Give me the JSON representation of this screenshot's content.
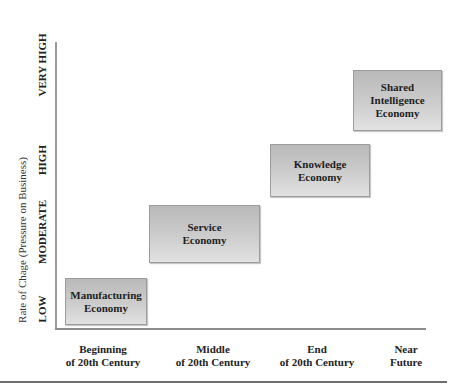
{
  "diagram": {
    "y_axis": {
      "title": "Rate of Chage (Pressure on Business)",
      "ticks": [
        "LOW",
        "MODERATE",
        "HIGH",
        "VERY HIGH"
      ]
    },
    "x_axis": {
      "ticks": [
        {
          "line1": "Beginning",
          "line2": "of 20th Century"
        },
        {
          "line1": "Middle",
          "line2": "of 20th Century"
        },
        {
          "line1": "End",
          "line2": "of 20th Century"
        },
        {
          "line1": "Near",
          "line2": "Future"
        }
      ]
    },
    "boxes": [
      {
        "line1": "Manufacturing",
        "line2": "Economy",
        "line3": ""
      },
      {
        "line1": "Service",
        "line2": "Economy",
        "line3": ""
      },
      {
        "line1": "Knowledge",
        "line2": "Economy",
        "line3": ""
      },
      {
        "line1": "Shared",
        "line2": "Intelligence",
        "line3": "Economy"
      }
    ],
    "colors": {
      "box_fill_top": "#b9b9b9",
      "box_fill_bottom": "#e2e2e2",
      "axis": "#8c8c8c"
    }
  }
}
